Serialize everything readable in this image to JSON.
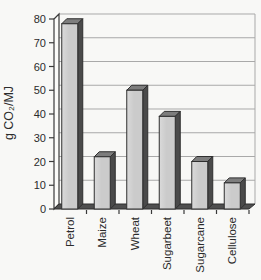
{
  "chart_data": {
    "type": "bar",
    "title": "",
    "xlabel": "",
    "ylabel": "g CO₂/MJ",
    "categories": [
      "Petrol",
      "Maize",
      "Wheat",
      "Sugarbeet",
      "Sugarcane",
      "Cellulose"
    ],
    "values": [
      78,
      22,
      50,
      39,
      20,
      11
    ],
    "ylim": [
      0,
      80
    ],
    "yticks": [
      0,
      10,
      20,
      30,
      40,
      50,
      60,
      70,
      80
    ],
    "grid": true,
    "legend_position": "none",
    "style_3d": true,
    "colors": {
      "bar_front": "#cbcbcb",
      "bar_front_light": "#dadada",
      "bar_side": "#4a4a4a",
      "bar_top": "#7d7d7d",
      "outline": "#2f2f2f",
      "gridline": "#a9a9a9",
      "axis": "#3a3a3a",
      "floor": "#4f4f4f",
      "wall": "#fbfbf9",
      "plot_background": "#f8f8f6",
      "text": "#2b2b2b"
    }
  }
}
